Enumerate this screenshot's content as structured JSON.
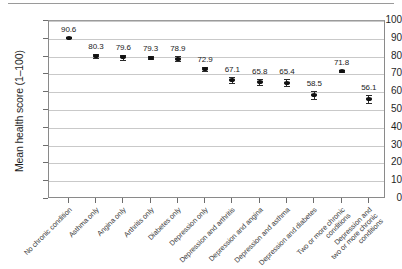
{
  "chart_data": {
    "type": "scatter",
    "title": "",
    "xlabel": "",
    "ylabel": "Mean health score (1–100)",
    "ylim": [
      0,
      100
    ],
    "ytick_labels": [
      "0",
      "10",
      "20",
      "30",
      "40",
      "50",
      "60",
      "70",
      "80",
      "90",
      "100"
    ],
    "ytick_values": [
      0,
      10,
      20,
      30,
      40,
      50,
      60,
      70,
      80,
      90,
      100
    ],
    "grid": "horizontal",
    "legend": "none",
    "error_bars": "95% confidence interval",
    "categories": [
      "No chronic condition",
      "Asthma only",
      "Angina only",
      "Arthritis only",
      "Diabetes only",
      "Depression only",
      "Depression and arthritis",
      "Depression and angina",
      "Depression and asthma",
      "Depression and diabetes",
      "Two or more chronic\nconditions",
      "Depression and\ntwo or more chronic\nconditions"
    ],
    "values": [
      90.6,
      80.3,
      79.6,
      79.3,
      78.9,
      72.9,
      67.1,
      65.8,
      65.4,
      58.5,
      71.8,
      56.1
    ],
    "value_labels": [
      "90.6",
      "80.3",
      "79.6",
      "79.3",
      "78.9",
      "72.9",
      "67.1",
      "65.8",
      "65.4",
      "58.5",
      "71.8",
      "56.1"
    ],
    "error_low": [
      90.2,
      79.3,
      78.3,
      78.5,
      77.6,
      71.7,
      65.4,
      63.9,
      63.6,
      56.2,
      71.1,
      53.9
    ],
    "error_high": [
      91.0,
      81.3,
      80.9,
      80.1,
      80.2,
      74.1,
      68.8,
      67.7,
      67.2,
      60.8,
      72.5,
      58.3
    ],
    "marker_color": "#111111",
    "gridline_color": "#c9c9c9",
    "axis_color": "#8a8a8a"
  }
}
